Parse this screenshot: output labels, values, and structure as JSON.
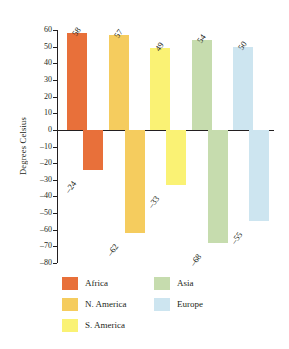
{
  "chart_data": {
    "type": "bar",
    "title": "",
    "xlabel": "",
    "ylabel": "Degrees Celsius",
    "ylim": [
      -80,
      60
    ],
    "ytick_labels": [
      "60",
      "50",
      "40",
      "30",
      "20",
      "10",
      "0",
      "–10",
      "–20",
      "–30",
      "–40",
      "–50",
      "–60",
      "–70",
      "–80"
    ],
    "ytick_values": [
      60,
      50,
      40,
      30,
      20,
      10,
      0,
      -10,
      -20,
      -30,
      -40,
      -50,
      -60,
      -70,
      -80
    ],
    "grid": false,
    "legend_position": "bottom",
    "categories": [
      "Africa",
      "N. America",
      "S. America",
      "Asia",
      "Europe"
    ],
    "series": [
      {
        "name": "Record high",
        "values": [
          58,
          57,
          49,
          54,
          50
        ],
        "labels": [
          "58",
          "57",
          "49",
          "54",
          "50"
        ]
      },
      {
        "name": "Record low",
        "values": [
          -24,
          -62,
          -33,
          -68,
          -55
        ],
        "labels": [
          "–24",
          "–62",
          "–33",
          "–68",
          "–55"
        ]
      }
    ],
    "colors": {
      "Africa": "#E8703A",
      "N. America": "#F5CC5E",
      "S. America": "#FAF274",
      "Asia": "#C6DCAE",
      "Europe": "#CDE5F0"
    },
    "axis_color": "#231f20"
  },
  "legend": {
    "items": [
      {
        "label": "Africa",
        "color": "#E8703A",
        "col": 0,
        "row": 0
      },
      {
        "label": "N. America",
        "color": "#F5CC5E",
        "col": 0,
        "row": 1
      },
      {
        "label": "S. America",
        "color": "#FAF274",
        "col": 0,
        "row": 2
      },
      {
        "label": "Asia",
        "color": "#C6DCAE",
        "col": 1,
        "row": 0
      },
      {
        "label": "Europe",
        "color": "#CDE5F0",
        "col": 1,
        "row": 1
      }
    ]
  }
}
